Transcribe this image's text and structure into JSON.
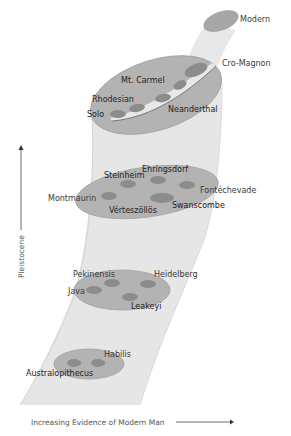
{
  "diagram": {
    "type": "evolution-funnel",
    "colors": {
      "funnel": "#e6e6e6",
      "funnel_edge": "#d2d2d2",
      "disk": "#b3b3b3",
      "disk_edge": "#9e9e9e",
      "oval": "#8c8c8c",
      "top_cap": "#a6a6a6",
      "text": "#333333"
    },
    "levels": [
      {
        "name": "top",
        "labels": [
          "Modern"
        ]
      },
      {
        "name": "upper",
        "labels": [
          "Cro-Magnon",
          "Mt. Carmel",
          "Rhodesian",
          "Neanderthal",
          "Solo"
        ]
      },
      {
        "name": "middle",
        "labels": [
          "Steinheim",
          "Ehringsdorf",
          "Fontéchevade",
          "Montmaurin",
          "Swanscombe",
          "Vérteszöllös"
        ]
      },
      {
        "name": "lower",
        "labels": [
          "Pekinensis",
          "Heidelberg",
          "Java",
          "Leakeyi"
        ]
      },
      {
        "name": "bottom",
        "labels": [
          "Habilis",
          "Australopithecus"
        ]
      }
    ],
    "labels": {
      "modern": "Modern",
      "cro_magnon": "Cro-Magnon",
      "mt_carmel": "Mt. Carmel",
      "rhodesian": "Rhodesian",
      "neanderthal": "Neanderthal",
      "solo": "Solo",
      "steinheim": "Steinheim",
      "ehringsdorf": "Ehringsdorf",
      "fontechevade": "Fontéchevade",
      "montmaurin": "Montmaurin",
      "swanscombe": "Swanscombe",
      "verteszollos": "Vérteszöllös",
      "pekinensis": "Pekinensis",
      "heidelberg": "Heidelberg",
      "java": "Java",
      "leakeyi": "Leakeyi",
      "habilis": "Habilis",
      "australopithecus": "Australopithecus"
    },
    "axes": {
      "x_label": "Increasing Evidence of Modern Man",
      "y_label": "Pleistocene"
    }
  }
}
